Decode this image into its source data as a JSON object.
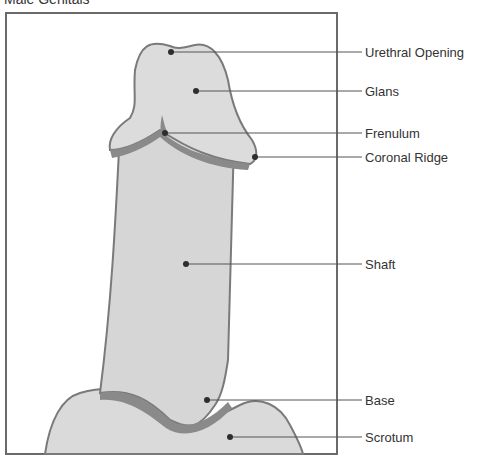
{
  "title": "Male Genitals",
  "colors": {
    "skin": "#dadada",
    "outline": "#7a7a7a",
    "shadow": "#8a8a8a",
    "leader": "#555555",
    "dot": "#2e2e2e",
    "frame": "#6a6a6a"
  },
  "labels": [
    {
      "id": "urethral-opening",
      "text": "Urethral Opening"
    },
    {
      "id": "glans",
      "text": "Glans"
    },
    {
      "id": "frenulum",
      "text": "Frenulum"
    },
    {
      "id": "coronal-ridge",
      "text": "Coronal Ridge"
    },
    {
      "id": "shaft",
      "text": "Shaft"
    },
    {
      "id": "base",
      "text": "Base"
    },
    {
      "id": "scrotum",
      "text": "Scrotum"
    }
  ]
}
